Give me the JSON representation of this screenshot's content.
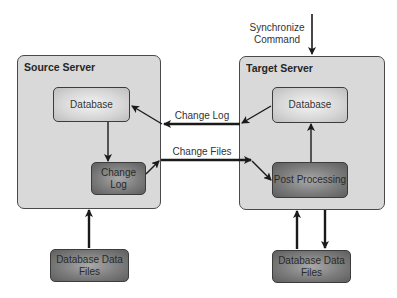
{
  "diagram": {
    "source_server": {
      "title": "Source Server",
      "database": "Database",
      "change_log": "Change Log",
      "data_files": "Database Data Files"
    },
    "target_server": {
      "title": "Target Server",
      "database": "Database",
      "post_processing": "Post Processing",
      "data_files": "Database Data Files"
    },
    "edges": {
      "sync_command": "Synchronize Command",
      "change_log": "Change Log",
      "change_files": "Change Files"
    },
    "colors": {
      "server_fill": "#d9d9d9",
      "light_node": "#e6e6e6",
      "dark_node": "#7d7d7d",
      "arrow": "#1a1a1a"
    }
  }
}
